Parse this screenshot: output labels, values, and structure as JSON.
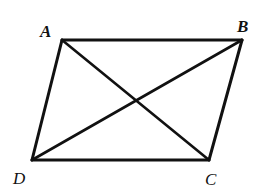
{
  "diagram": {
    "type": "parallelogram-with-diagonals",
    "vertices": {
      "A": {
        "label": "A",
        "x": 62,
        "y": 40
      },
      "B": {
        "label": "B",
        "x": 242,
        "y": 40
      },
      "C": {
        "label": "C",
        "x": 209,
        "y": 160
      },
      "D": {
        "label": "D",
        "x": 32,
        "y": 160
      }
    },
    "edges": [
      [
        "A",
        "B"
      ],
      [
        "B",
        "C"
      ],
      [
        "C",
        "D"
      ],
      [
        "D",
        "A"
      ]
    ],
    "diagonals": [
      [
        "A",
        "C"
      ],
      [
        "B",
        "D"
      ]
    ],
    "colors": {
      "stroke": "#111111",
      "background": "#ffffff"
    }
  }
}
